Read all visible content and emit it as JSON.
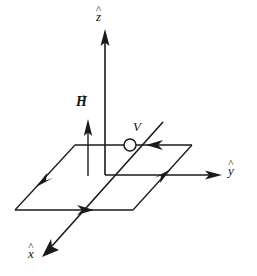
{
  "figure": {
    "background_color": "#ffffff",
    "stroke_color": "#1a1a1a"
  },
  "axes": [
    {
      "id": "z",
      "name": "z-axis",
      "label": "z",
      "accent": "^",
      "accent_name": "hat",
      "direction": "up",
      "arrow": "at-tip"
    },
    {
      "id": "y",
      "name": "y-axis",
      "label": "y",
      "accent": "^",
      "accent_name": "hat",
      "direction": "right",
      "arrow": "at-tip"
    },
    {
      "id": "x",
      "name": "x-axis",
      "label": "x",
      "accent": "^",
      "accent_name": "hat",
      "direction": "down-left",
      "arrow": "at-tip"
    }
  ],
  "vectors": [
    {
      "id": "H",
      "name": "magnetic-field-vector",
      "label": "H",
      "accent": "→",
      "accent_name": "vector-arrow",
      "direction": "up",
      "bold": true
    }
  ],
  "nodes": [
    {
      "id": "V",
      "name": "voltage-source",
      "label": "V",
      "shape": "open-circle"
    }
  ],
  "loop": {
    "name": "current-loop",
    "shape": "parallelogram",
    "plane": "xy",
    "edge_arrow_count": 4,
    "circulation": "clockwise-viewed-from-plus-z",
    "edges": [
      {
        "name": "loop-edge-top",
        "arrow_direction": "left"
      },
      {
        "name": "loop-edge-left",
        "arrow_direction": "down-left"
      },
      {
        "name": "loop-edge-bottom",
        "arrow_direction": "right"
      },
      {
        "name": "loop-edge-right",
        "arrow_direction": "up-right"
      }
    ]
  }
}
